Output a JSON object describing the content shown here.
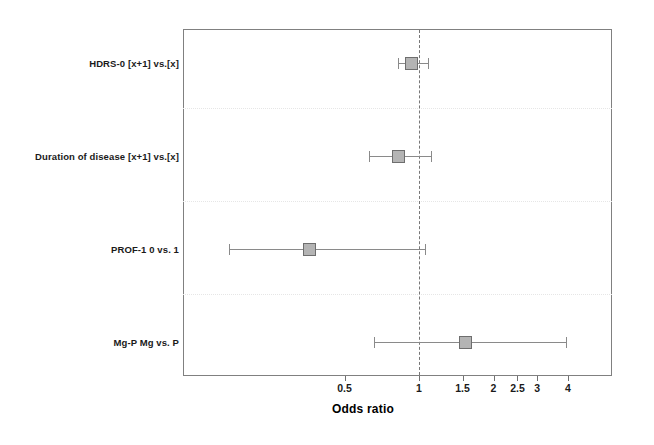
{
  "chart_data": {
    "type": "scatter",
    "subtype": "forest-plot",
    "title": "",
    "xlabel": "Odds ratio",
    "ylabel": "",
    "xscale": "log",
    "xlim": [
      0.36,
      5.2
    ],
    "grid": "faint dotted horizontal separators between rows",
    "legend": "none",
    "reference_line": 1,
    "xticks": [
      0.5,
      1,
      1.5,
      2,
      2.5,
      3,
      4
    ],
    "xtick_labels": [
      "0.5",
      "1",
      "1.5",
      "2",
      "2.5",
      "3",
      "4"
    ],
    "categories": [
      "HDRS-0 [x+1] vs.[x]",
      "Duration of disease [x+1] vs.[x]",
      "PROF-1  0 vs. 1",
      "Mg-P  Mg vs. P"
    ],
    "points": [
      {
        "label": "HDRS-0 [x+1] vs.[x]",
        "or": 0.93,
        "ci_low": 0.82,
        "ci_high": 1.09
      },
      {
        "label": "Duration of disease [x+1] vs.[x]",
        "or": 0.83,
        "ci_low": 0.63,
        "ci_high": 1.12
      },
      {
        "label": "PROF-1  0 vs. 1",
        "or": 0.36,
        "ci_low": 0.17,
        "ci_high": 1.06
      },
      {
        "label": "Mg-P  Mg vs. P",
        "or": 1.54,
        "ci_low": 0.66,
        "ci_high": 3.91
      }
    ],
    "colors": {
      "marker_fill": "#b4b4b4",
      "marker_border": "#6e6e6e",
      "whisker": "#8a8a8a",
      "frame": "#808080",
      "reference_line": "#777777",
      "separator": "#e6e6e6",
      "text": "#1a1a1a",
      "background": "#ffffff"
    }
  },
  "axis": {
    "title": "Odds ratio"
  }
}
